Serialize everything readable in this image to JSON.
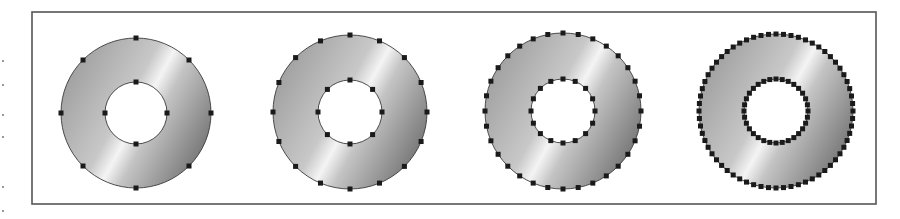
{
  "figure": {
    "frame": {
      "x": 32,
      "y": 12,
      "width": 844,
      "height": 192,
      "stroke": "#555555"
    },
    "fill_gradient": {
      "angle_note": "diagonal highlight band from lower-right to upper-left",
      "stops": [
        {
          "offset": 0.0,
          "color": "#9c9c9c"
        },
        {
          "offset": 0.42,
          "color": "#c8c8c8"
        },
        {
          "offset": 0.52,
          "color": "#f4f4f4"
        },
        {
          "offset": 0.62,
          "color": "#c4c4c4"
        },
        {
          "offset": 1.0,
          "color": "#6e6e6e"
        }
      ]
    },
    "point_color": "#1a1a1a",
    "point_size": 5,
    "rings": [
      {
        "id": "ring-1",
        "cx": 136,
        "cy": 113,
        "outer_r": 75,
        "inner_r": 31,
        "outer_points": 8,
        "inner_points": 4
      },
      {
        "id": "ring-2",
        "cx": 350,
        "cy": 112,
        "outer_r": 77,
        "inner_r": 32,
        "outer_points": 16,
        "inner_points": 8
      },
      {
        "id": "ring-3",
        "cx": 563,
        "cy": 111,
        "outer_r": 78,
        "inner_r": 32,
        "outer_points": 32,
        "inner_points": 16
      },
      {
        "id": "ring-4",
        "cx": 776,
        "cy": 111,
        "outer_r": 77,
        "inner_r": 32,
        "outer_points": 64,
        "inner_points": 32
      }
    ]
  }
}
